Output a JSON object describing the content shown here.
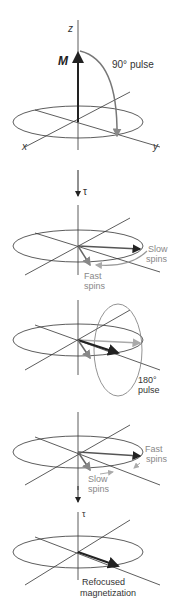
{
  "colors": {
    "axis": "#333333",
    "main_vector": "#222222",
    "gray_vector": "#888888",
    "light_vector": "#aaaaaa"
  },
  "panel1": {
    "z_label": "z",
    "m_label": "M",
    "pulse_label": "90° pulse",
    "x_label": "x",
    "y_label": "y"
  },
  "arrow1": {
    "tau_label": "τ"
  },
  "panel2": {
    "slow_label_1": "Slow",
    "slow_label_2": "spins",
    "fast_label_1": "Fast",
    "fast_label_2": "spins"
  },
  "panel3": {
    "pulse_label_1": "180°",
    "pulse_label_2": "pulse"
  },
  "panel4": {
    "fast_label_1": "Fast",
    "fast_label_2": "spins",
    "slow_label_1": "Slow",
    "slow_label_2": "spins"
  },
  "arrow2": {
    "tau_label": "τ"
  },
  "panel5": {
    "refocused_label_1": "Refocused",
    "refocused_label_2": "magnetization"
  }
}
